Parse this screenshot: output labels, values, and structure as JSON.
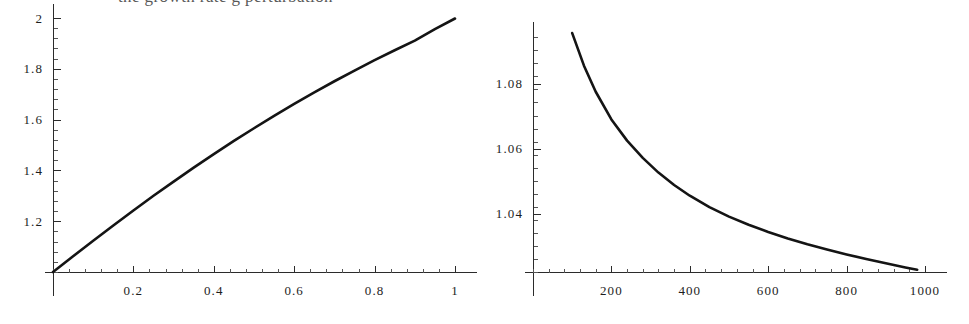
{
  "caption": {
    "text": "the growth rate g perturbation"
  },
  "figures": [
    {
      "name": "left-plot",
      "chart_data": {
        "type": "line",
        "title": "",
        "xlabel": "",
        "ylabel": "",
        "xlim": [
          0,
          1
        ],
        "ylim": [
          1,
          2
        ],
        "grid": false,
        "legend": "none",
        "x_ticks": [
          0.2,
          0.4,
          0.6,
          0.8,
          1
        ],
        "x_tick_labels": [
          "0.2",
          "0.4",
          "0.6",
          "0.8",
          "1"
        ],
        "y_ticks": [
          1.2,
          1.4,
          1.6,
          1.8,
          2
        ],
        "y_tick_labels": [
          "1.2",
          "1.4",
          "1.6",
          "1.8",
          "2"
        ],
        "x_minor_tick_count": 4,
        "y_minor_tick_count": 4,
        "series": [
          {
            "name": "curve-1",
            "x": [
              0.0,
              0.05,
              0.1,
              0.15,
              0.2,
              0.25,
              0.3,
              0.35,
              0.4,
              0.45,
              0.5,
              0.55,
              0.6,
              0.65,
              0.7,
              0.75,
              0.8,
              0.85,
              0.9,
              0.95,
              1.0
            ],
            "y": [
              1.0,
              1.062,
              1.123,
              1.183,
              1.242,
              1.3,
              1.356,
              1.411,
              1.464,
              1.516,
              1.566,
              1.615,
              1.662,
              1.707,
              1.751,
              1.793,
              1.834,
              1.873,
              1.911,
              1.956,
              1.998
            ]
          }
        ]
      }
    },
    {
      "name": "right-plot",
      "chart_data": {
        "type": "line",
        "title": "",
        "xlabel": "",
        "ylabel": "",
        "xlim": [
          0,
          1000
        ],
        "ylim": [
          1.02,
          1.097
        ],
        "grid": false,
        "legend": "none",
        "x_ticks": [
          200,
          400,
          600,
          800,
          1000
        ],
        "x_tick_labels": [
          "200",
          "400",
          "600",
          "800",
          "1000"
        ],
        "y_ticks": [
          1.04,
          1.06,
          1.08
        ],
        "y_tick_labels": [
          "1.04",
          "1.06",
          "1.08"
        ],
        "x_minor_tick_count": 4,
        "y_minor_tick_count": 4,
        "series": [
          {
            "name": "curve-1",
            "x": [
              100,
              130,
              160,
              200,
              240,
              280,
              320,
              360,
              400,
              450,
              500,
              550,
              600,
              650,
              700,
              750,
              800,
              850,
              900,
              950,
              980
            ],
            "y": [
              1.0955,
              1.0855,
              1.0775,
              1.069,
              1.0625,
              1.0572,
              1.0527,
              1.0489,
              1.0456,
              1.0421,
              1.0392,
              1.0367,
              1.0345,
              1.0325,
              1.0307,
              1.0291,
              1.0276,
              1.0262,
              1.0249,
              1.0236,
              1.0229
            ]
          }
        ]
      }
    }
  ]
}
